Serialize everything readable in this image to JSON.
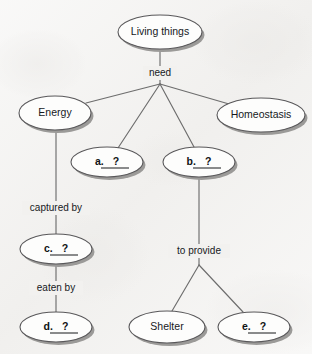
{
  "diagram": {
    "type": "concept-map",
    "background_color": "#f2f1ef",
    "node_fill": "#fdfdfc",
    "node_stroke": "#59585a",
    "node_shadow": "#9b9a98",
    "edge_color": "#6d6d6d",
    "text_color": "#16191c"
  },
  "nodes": [
    {
      "id": "living-things",
      "label": "Living things",
      "cx": 160,
      "cy": 32,
      "rx": 42,
      "ry": 17,
      "kind": "concept"
    },
    {
      "id": "energy",
      "label": "Energy",
      "cx": 55,
      "cy": 113,
      "rx": 36,
      "ry": 17,
      "kind": "concept"
    },
    {
      "id": "homeostasis",
      "label": "Homeostasis",
      "cx": 261,
      "cy": 115,
      "rx": 44,
      "ry": 17,
      "kind": "concept"
    },
    {
      "id": "blank-a",
      "label": "a.",
      "cx": 107,
      "cy": 162,
      "rx": 36,
      "ry": 15,
      "kind": "blank"
    },
    {
      "id": "blank-b",
      "label": "b.",
      "cx": 199,
      "cy": 162,
      "rx": 36,
      "ry": 15,
      "kind": "blank"
    },
    {
      "id": "blank-c",
      "label": "c.",
      "cx": 56,
      "cy": 249,
      "rx": 36,
      "ry": 15,
      "kind": "blank"
    },
    {
      "id": "blank-d",
      "label": "d.",
      "cx": 56,
      "cy": 327,
      "rx": 36,
      "ry": 15,
      "kind": "blank"
    },
    {
      "id": "shelter",
      "label": "Shelter",
      "cx": 167,
      "cy": 327,
      "rx": 38,
      "ry": 16,
      "kind": "concept"
    },
    {
      "id": "blank-e",
      "label": "e.",
      "cx": 254,
      "cy": 327,
      "rx": 36,
      "ry": 15,
      "kind": "blank"
    }
  ],
  "blank_placeholder": "?",
  "edge_labels": [
    {
      "id": "need",
      "text": "need",
      "x": 160,
      "y": 73,
      "halfwidth": 15
    },
    {
      "id": "captured-by",
      "text": "captured by",
      "x": 56,
      "y": 208,
      "halfwidth": 32
    },
    {
      "id": "eaten-by",
      "text": "eaten by",
      "x": 56,
      "y": 288,
      "halfwidth": 25
    },
    {
      "id": "to-provide",
      "text": "to provide",
      "x": 199,
      "y": 251,
      "halfwidth": 29
    }
  ],
  "edges": [
    {
      "id": "living-to-junction",
      "from": "living-things",
      "to": "need-junction",
      "points": "160,49 160,84"
    },
    {
      "id": "junction-to-energy",
      "from": "need-junction",
      "to": "energy",
      "points": "160,84 86,103"
    },
    {
      "id": "junction-to-a",
      "from": "need-junction",
      "to": "blank-a",
      "points": "160,84 118,148"
    },
    {
      "id": "junction-to-b",
      "from": "need-junction",
      "to": "blank-b",
      "points": "160,84 194,147"
    },
    {
      "id": "junction-to-homeo",
      "from": "need-junction",
      "to": "homeostasis",
      "points": "160,84 229,104"
    },
    {
      "id": "energy-to-c",
      "from": "energy",
      "to": "blank-c",
      "points": "56,130 56,234"
    },
    {
      "id": "c-to-d",
      "from": "blank-c",
      "to": "blank-d",
      "points": "56,264 56,312"
    },
    {
      "id": "b-to-junction",
      "from": "blank-b",
      "to": "provide-junction",
      "points": "199,177 199,265"
    },
    {
      "id": "junction-to-shelter",
      "from": "provide-junction",
      "to": "shelter",
      "points": "199,265 172,311"
    },
    {
      "id": "junction-to-e",
      "from": "provide-junction",
      "to": "blank-e",
      "points": "199,265 243,312"
    }
  ]
}
